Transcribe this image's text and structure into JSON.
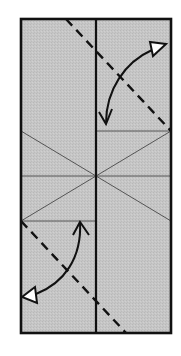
{
  "diagram": {
    "type": "origami-fold-step",
    "colors": {
      "paper": "#c4c4c4",
      "outline": "#111111",
      "crease": "#555555",
      "fold_line": "#111111",
      "arrow": "#111111",
      "background": "#ffffff"
    },
    "paper_rect": {
      "x": 21,
      "y": 19,
      "width": 150,
      "height": 314
    },
    "center_line": {
      "x1": 96,
      "y1": 19,
      "x2": 96,
      "y2": 333
    },
    "creases": [
      {
        "name": "crease-center-horizontal",
        "x1": 21,
        "y1": 176,
        "x2": 171,
        "y2": 176
      },
      {
        "name": "crease-right-horizontal",
        "x1": 96,
        "y1": 131,
        "x2": 171,
        "y2": 131
      },
      {
        "name": "crease-left-horizontal",
        "x1": 21,
        "y1": 221,
        "x2": 96,
        "y2": 221
      },
      {
        "name": "crease-diagonal-1",
        "x1": 21,
        "y1": 131,
        "x2": 171,
        "y2": 221
      },
      {
        "name": "crease-diagonal-2",
        "x1": 171,
        "y1": 131,
        "x2": 21,
        "y2": 221
      }
    ],
    "valley_folds": [
      {
        "name": "valley-fold-top-right",
        "x1": 66,
        "y1": 19,
        "x2": 171,
        "y2": 131
      },
      {
        "name": "valley-fold-bottom-left",
        "x1": 21,
        "y1": 221,
        "x2": 126,
        "y2": 333
      }
    ],
    "arrows": [
      {
        "name": "fold-arrow-top-right",
        "direction": "fold and unfold"
      },
      {
        "name": "fold-arrow-bottom-left",
        "direction": "fold and unfold"
      }
    ]
  }
}
